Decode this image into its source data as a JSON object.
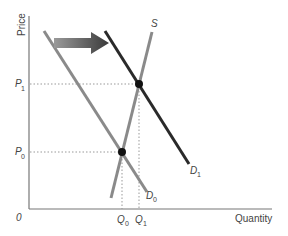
{
  "diagram": {
    "type": "supply-demand",
    "axes": {
      "y_label": "Price",
      "x_label": "Quantity",
      "origin_label": "0"
    },
    "price_levels": [
      {
        "label": "P",
        "sub": "1"
      },
      {
        "label": "P",
        "sub": "0"
      }
    ],
    "quantity_levels": [
      {
        "label": "Q",
        "sub": "0"
      },
      {
        "label": "Q",
        "sub": "1"
      }
    ],
    "curves": {
      "supply": {
        "label": "S",
        "color": "#8a8a8a"
      },
      "demand_initial": {
        "label": "D",
        "sub": "0",
        "color": "#8a8a8a"
      },
      "demand_new": {
        "label": "D",
        "sub": "1",
        "color": "#2a2a2a"
      }
    },
    "shift_arrow": {
      "direction": "right",
      "color": "#555555"
    },
    "equilibria": [
      {
        "name": "initial",
        "price": "P0",
        "quantity": "Q0"
      },
      {
        "name": "new",
        "price": "P1",
        "quantity": "Q1"
      }
    ],
    "colors": {
      "axis": "#777777",
      "guide": "#999999",
      "point": "#111111"
    }
  }
}
